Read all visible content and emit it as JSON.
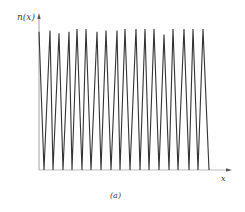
{
  "chart_data": {
    "type": "line",
    "title": "",
    "subtitle": "",
    "xlabel": "x",
    "ylabel": "n(x)",
    "caption": "(a)",
    "grid": false,
    "legend": null,
    "x": [
      0,
      0.5,
      1.0,
      1.5,
      2.0,
      2.5,
      3.0,
      3.5,
      4.0,
      4.5,
      5.0,
      5.5,
      6.0,
      6.5,
      7.0,
      7.5,
      8.0,
      8.5,
      9.0,
      9.5,
      10.0,
      10.5,
      11.0,
      11.5,
      12.0,
      12.5,
      13.0,
      13.5,
      14.0,
      14.5,
      15.0,
      15.5,
      16.0,
      16.5,
      17.0,
      17.5
    ],
    "series": [
      {
        "name": "n(x)",
        "peaks_x": [
          39,
          50,
          59,
          69,
          77,
          86,
          97,
          106,
          117,
          125,
          136,
          145,
          154,
          164,
          173,
          184,
          193,
          203
        ],
        "troughs_x": [
          44,
          53,
          63,
          72,
          82,
          91,
          101,
          111,
          120,
          130,
          140,
          149,
          159,
          169,
          178,
          189,
          198,
          209
        ],
        "peak_values": [
          0.98,
          0.99,
          0.97,
          0.98,
          1.0,
          1.0,
          0.98,
          0.99,
          0.99,
          1.0,
          1.0,
          1.0,
          1.0,
          0.96,
          1.0,
          1.0,
          1.0,
          1.0
        ],
        "trough_value": 0
      }
    ],
    "ylim": [
      0,
      1.1
    ],
    "xlim": [
      0,
      19
    ]
  },
  "axes": {
    "y_label": "n(x)",
    "x_label": "x"
  },
  "caption": "(a)",
  "colors": {
    "line": "#333333",
    "axis": "#888888"
  }
}
